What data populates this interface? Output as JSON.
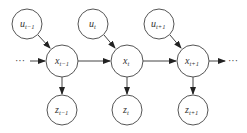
{
  "diagram": {
    "type": "dynamic-bayesian-network",
    "nodes": [
      {
        "id": "u_t-1",
        "base": "u",
        "sub": "t-1",
        "cx": 27,
        "cy": 24,
        "r": 15
      },
      {
        "id": "u_t",
        "base": "u",
        "sub": "t",
        "cx": 93,
        "cy": 24,
        "r": 15
      },
      {
        "id": "u_t+1",
        "base": "u",
        "sub": "t+1",
        "cx": 159,
        "cy": 24,
        "r": 15
      },
      {
        "id": "x_t-1",
        "base": "x",
        "sub": "t-1",
        "cx": 62,
        "cy": 61,
        "r": 16
      },
      {
        "id": "x_t",
        "base": "x",
        "sub": "t",
        "cx": 127,
        "cy": 61,
        "r": 16
      },
      {
        "id": "x_t+1",
        "base": "x",
        "sub": "t+1",
        "cx": 193,
        "cy": 61,
        "r": 16
      },
      {
        "id": "z_t-1",
        "base": "z",
        "sub": "t-1",
        "cx": 62,
        "cy": 110,
        "r": 15
      },
      {
        "id": "z_t",
        "base": "z",
        "sub": "t",
        "cx": 127,
        "cy": 110,
        "r": 15
      },
      {
        "id": "z_t+1",
        "base": "z",
        "sub": "t+1",
        "cx": 193,
        "cy": 110,
        "r": 15
      }
    ],
    "edges": [
      {
        "from": "u_t-1",
        "to": "x_t-1"
      },
      {
        "from": "u_t",
        "to": "x_t"
      },
      {
        "from": "u_t+1",
        "to": "x_t+1"
      },
      {
        "from": "x_t-1",
        "to": "x_t"
      },
      {
        "from": "x_t",
        "to": "x_t+1"
      },
      {
        "from": "x_t-1",
        "to": "z_t-1"
      },
      {
        "from": "x_t",
        "to": "z_t"
      },
      {
        "from": "x_t+1",
        "to": "z_t+1"
      },
      {
        "from": "start-ellipsis",
        "to": "x_t-1"
      },
      {
        "from": "x_t+1",
        "to": "end-ellipsis"
      }
    ],
    "ellipsis_left": "···",
    "ellipsis_right": "···",
    "labels": {
      "u_t-1": {
        "base": "u",
        "sub": "t−1"
      },
      "u_t": {
        "base": "u",
        "sub": "t"
      },
      "u_t+1": {
        "base": "u",
        "sub": "t+1"
      },
      "x_t-1": {
        "base": "x",
        "sub": "t−1"
      },
      "x_t": {
        "base": "x",
        "sub": "t"
      },
      "x_t+1": {
        "base": "x",
        "sub": "t+1"
      },
      "z_t-1": {
        "base": "z",
        "sub": "t−1"
      },
      "z_t": {
        "base": "z",
        "sub": "t"
      },
      "z_t+1": {
        "base": "z",
        "sub": "t+1"
      }
    },
    "colors": {
      "stroke": "#555555",
      "text": "#333333",
      "background": "#ffffff"
    }
  }
}
